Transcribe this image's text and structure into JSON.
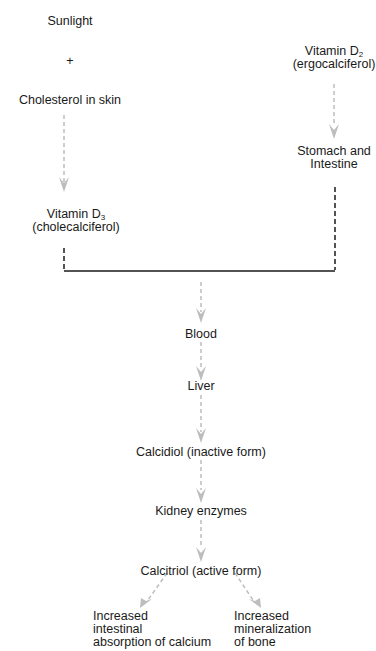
{
  "diagram": {
    "colors": {
      "text": "#1a1a1a",
      "arrow": "#bdbdbd",
      "connector": "#1a1a1a"
    },
    "nodes": {
      "sunlight": "Sunlight",
      "plus": "+",
      "cholesterol": "Cholesterol in skin",
      "vitd3_main": "Vitamin D",
      "vitd3_sub": "3",
      "vitd3_alt": "(cholecalciferol)",
      "vitd2_main": "Vitamin D",
      "vitd2_sub": "2",
      "vitd2_alt": "(ergocalciferol)",
      "stomach_line1": "Stomach and",
      "stomach_line2": "Intestine",
      "blood": "Blood",
      "liver": "Liver",
      "calcidiol": "Calcidiol (inactive form)",
      "kidney": "Kidney enzymes",
      "calcitriol": "Calcitriol (active form)",
      "out1_line1": "Increased",
      "out1_line2": "intestinal",
      "out1_line3": "absorption of calcium",
      "out2_line1": "Increased",
      "out2_line2": "mineralization",
      "out2_line3": "of bone"
    },
    "edges": [
      {
        "from": "Cholesterol in skin",
        "to": "Vitamin D3",
        "style": "dashed-arrow"
      },
      {
        "from": "Vitamin D2",
        "to": "Stomach and Intestine",
        "style": "dashed-arrow"
      },
      {
        "from": "Vitamin D3",
        "to": "junction",
        "style": "dashed-bracket"
      },
      {
        "from": "Stomach and Intestine",
        "to": "junction",
        "style": "dashed-bracket"
      },
      {
        "from": "junction",
        "to": "Blood",
        "style": "dashed-arrow"
      },
      {
        "from": "Blood",
        "to": "Liver",
        "style": "dashed-arrow"
      },
      {
        "from": "Liver",
        "to": "Calcidiol",
        "style": "dashed-arrow"
      },
      {
        "from": "Calcidiol",
        "to": "Kidney enzymes",
        "style": "dashed-arrow"
      },
      {
        "from": "Kidney enzymes",
        "to": "Calcitriol",
        "style": "dashed-arrow"
      },
      {
        "from": "Calcitriol",
        "to": "Increased intestinal absorption of calcium",
        "style": "dashed-arrow"
      },
      {
        "from": "Calcitriol",
        "to": "Increased mineralization of bone",
        "style": "dashed-arrow"
      }
    ]
  }
}
